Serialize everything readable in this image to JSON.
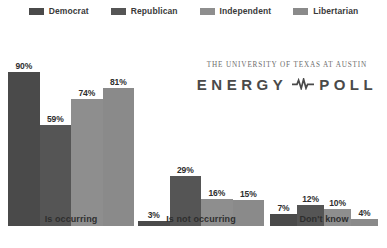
{
  "legend": {
    "items": [
      {
        "label": "Democrat",
        "color": "#4a4a4a"
      },
      {
        "label": "Republican",
        "color": "#555555"
      },
      {
        "label": "Independent",
        "color": "#8e8e8e"
      },
      {
        "label": "Libertarian",
        "color": "#8a8a8a"
      }
    ]
  },
  "logo": {
    "tagline": "THE UNIVERSITY OF TEXAS AT AUSTIN",
    "word_left": "ENERGY",
    "word_right": "POLL",
    "pulse_icon": "pulse-icon"
  },
  "chart_data": {
    "type": "bar",
    "title": "",
    "xlabel": "",
    "ylabel": "",
    "ylim": [
      0,
      100
    ],
    "grid": false,
    "legend_position": "top",
    "value_suffix": "%",
    "categories": [
      "Is occurring",
      "Is not occurring",
      "Don't know"
    ],
    "series": [
      {
        "name": "Democrat",
        "color": "#4a4a4a",
        "values": [
          90,
          3,
          7
        ]
      },
      {
        "name": "Republican",
        "color": "#555555",
        "values": [
          59,
          29,
          12
        ]
      },
      {
        "name": "Independent",
        "color": "#8e8e8e",
        "values": [
          74,
          16,
          10
        ]
      },
      {
        "name": "Libertarian",
        "color": "#8a8a8a",
        "values": [
          81,
          15,
          4
        ]
      }
    ],
    "labels": {
      "group_0": [
        "90%",
        "59%",
        "74%",
        "81%"
      ],
      "group_1": [
        "3%",
        "29%",
        "16%",
        "15%"
      ],
      "group_2": [
        "7%",
        "12%",
        "10%",
        "4%"
      ]
    }
  }
}
